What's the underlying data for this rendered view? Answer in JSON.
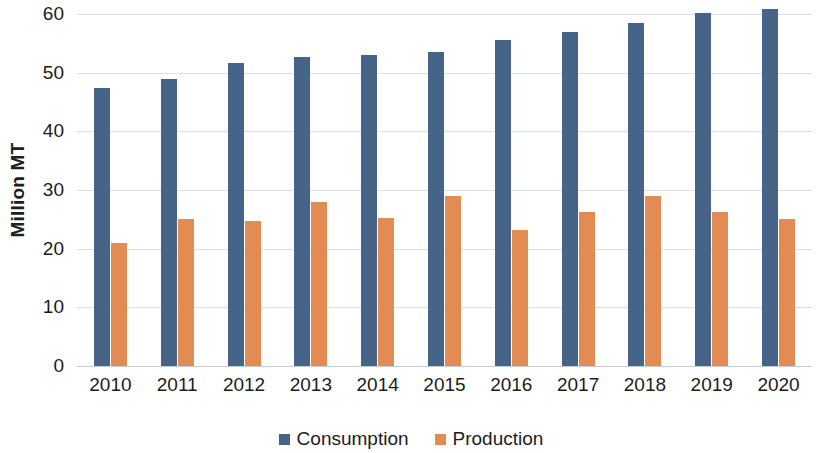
{
  "chart_data": {
    "type": "bar",
    "title": "",
    "xlabel": "",
    "ylabel": "Million MT",
    "ylim": [
      0,
      60
    ],
    "yticks": [
      0,
      10,
      20,
      30,
      40,
      50,
      60
    ],
    "ytick_labels": [
      "0",
      "10",
      "20",
      "30",
      "40",
      "50",
      "60"
    ],
    "grid": true,
    "legend_position": "bottom",
    "categories": [
      "2010",
      "2011",
      "2012",
      "2013",
      "2014",
      "2015",
      "2016",
      "2017",
      "2018",
      "2019",
      "2020"
    ],
    "series": [
      {
        "name": "Consumption",
        "color": "#456487",
        "values": [
          47.4,
          48.9,
          51.6,
          52.6,
          53.0,
          53.6,
          55.6,
          56.9,
          58.4,
          60.2,
          60.9
        ]
      },
      {
        "name": "Production",
        "color": "#e28b52",
        "values": [
          20.9,
          25.0,
          24.7,
          28.0,
          25.3,
          29.0,
          23.2,
          26.3,
          28.9,
          26.2,
          25.1
        ]
      }
    ]
  }
}
